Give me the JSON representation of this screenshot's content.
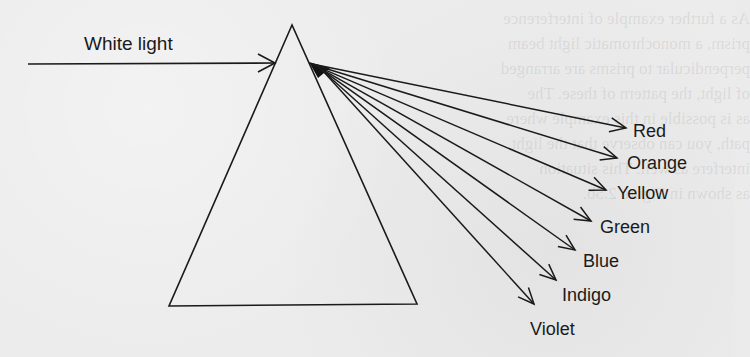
{
  "figure": {
    "incident_label": "White light",
    "spectrum": [
      {
        "name": "Red",
        "label_x": 633,
        "label_y": 122,
        "tip_x": 626,
        "tip_y": 128
      },
      {
        "name": "Orange",
        "label_x": 627,
        "label_y": 154,
        "tip_x": 617,
        "tip_y": 158
      },
      {
        "name": "Yellow",
        "label_x": 617,
        "label_y": 184,
        "tip_x": 606,
        "tip_y": 190
      },
      {
        "name": "Green",
        "label_x": 600,
        "label_y": 218,
        "tip_x": 591,
        "tip_y": 221
      },
      {
        "name": "Blue",
        "label_x": 583,
        "label_y": 252,
        "tip_x": 575,
        "tip_y": 250
      },
      {
        "name": "Indigo",
        "label_x": 562,
        "label_y": 286,
        "tip_x": 556,
        "tip_y": 280
      },
      {
        "name": "Violet",
        "label_x": 530,
        "label_y": 320,
        "tip_x": 534,
        "tip_y": 304
      }
    ],
    "colors": {
      "ink": "#1a1a1a",
      "paper": "#ececec"
    }
  },
  "background_bleed": {
    "lines": [
      "As a further example of interference",
      "prism, a monochromatic light beam",
      "perpendicular to prisms are arranged",
      "of light, the pattern of these. The",
      "as is possible in this example where",
      "path, you can observe that the light",
      "interfere as well. This situation",
      "as shown in Figure 2.5b."
    ]
  }
}
